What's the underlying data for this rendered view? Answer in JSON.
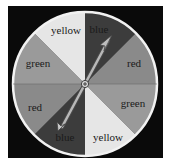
{
  "spinner": {
    "sectors": [
      {
        "label": "blue",
        "shade": "#3c3c3c"
      },
      {
        "label": "red",
        "shade": "#8a8a8a"
      },
      {
        "label": "green",
        "shade": "#9a9a9a"
      },
      {
        "label": "yellow",
        "shade": "#e6e6e6"
      },
      {
        "label": "blue",
        "shade": "#3c3c3c"
      },
      {
        "label": "red",
        "shade": "#8a8a8a"
      },
      {
        "label": "green",
        "shade": "#9a9a9a"
      },
      {
        "label": "yellow",
        "shade": "#e6e6e6"
      }
    ],
    "arrow_points_to": "blue"
  }
}
